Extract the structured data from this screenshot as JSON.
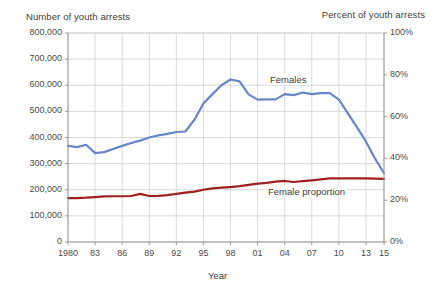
{
  "axes": {
    "left_title": "Number of youth arrests",
    "right_title": "Percent of youth arrests",
    "xlabel": "Year",
    "left_ticks": [
      "800,000",
      "700,000",
      "600,000",
      "500,000",
      "400,000",
      "300,000",
      "200,000",
      "100,000",
      "0"
    ],
    "right_ticks": [
      "100%",
      "80%",
      "60%",
      "40%",
      "20%",
      "0%"
    ],
    "x_ticks": [
      "1980",
      "83",
      "86",
      "89",
      "92",
      "95",
      "98",
      "01",
      "04",
      "07",
      "10",
      "13",
      "15"
    ]
  },
  "labels": {
    "females": "Females",
    "female_proportion": "Female proportion"
  },
  "colors": {
    "females_line": "#6a86c8",
    "proportion_line": "#9e2020",
    "grid": "#cfcfcf",
    "axis": "#9a9a9a",
    "background": "#ffffff",
    "text": "#3d3d3d"
  },
  "chart_data": {
    "type": "line",
    "title": "",
    "xlabel": "Year",
    "ylabel": "Number of youth arrests",
    "y2label": "Percent of youth arrests",
    "ylim": [
      0,
      800000
    ],
    "y2lim": [
      0,
      100
    ],
    "xlim": [
      1980,
      2015
    ],
    "grid": true,
    "legend": "inline-annotations",
    "x": [
      1980,
      1981,
      1982,
      1983,
      1984,
      1985,
      1986,
      1987,
      1988,
      1989,
      1990,
      1991,
      1992,
      1993,
      1994,
      1995,
      1996,
      1997,
      1998,
      1999,
      2000,
      2001,
      2002,
      2003,
      2004,
      2005,
      2006,
      2007,
      2008,
      2009,
      2010,
      2011,
      2012,
      2013,
      2014,
      2015
    ],
    "series": [
      {
        "name": "Females",
        "axis": "left",
        "color": "#6a86c8",
        "unit": "arrests",
        "values": [
          368000,
          363000,
          372000,
          340000,
          344000,
          356000,
          368000,
          379000,
          388000,
          400000,
          408000,
          414000,
          421000,
          423000,
          468000,
          530000,
          566000,
          600000,
          622000,
          615000,
          565000,
          545000,
          546000,
          546000,
          566000,
          562000,
          572000,
          566000,
          570000,
          570000,
          545000,
          492000,
          440000,
          385000,
          320000,
          263000
        ]
      },
      {
        "name": "Female proportion",
        "axis": "right",
        "color": "#9e2020",
        "unit": "percent",
        "values": [
          21.0,
          21.0,
          21.2,
          21.5,
          21.8,
          21.9,
          21.9,
          22.0,
          23.0,
          22.0,
          22.1,
          22.4,
          23.0,
          23.6,
          24.1,
          25.0,
          25.7,
          26.0,
          26.3,
          26.7,
          27.3,
          27.9,
          28.3,
          28.9,
          29.2,
          28.7,
          29.1,
          29.5,
          30.0,
          30.4,
          30.4,
          30.4,
          30.4,
          30.4,
          30.3,
          30.2
        ]
      }
    ]
  }
}
